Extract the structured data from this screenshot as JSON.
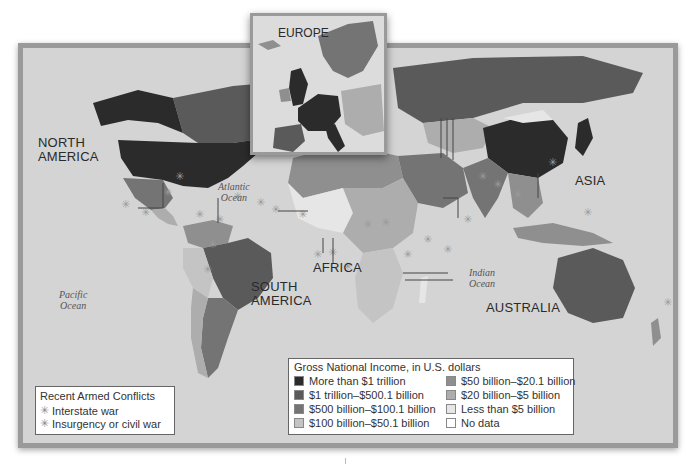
{
  "map": {
    "continent_labels": [
      {
        "id": "north-america",
        "lines": [
          "NORTH",
          "AMERICA"
        ]
      },
      {
        "id": "south-america",
        "lines": [
          "SOUTH",
          "AMERICA"
        ]
      },
      {
        "id": "africa",
        "lines": [
          "AFRICA"
        ]
      },
      {
        "id": "asia",
        "lines": [
          "ASIA"
        ]
      },
      {
        "id": "australia",
        "lines": [
          "AUSTRALIA"
        ]
      }
    ],
    "ocean_labels": [
      {
        "id": "atlantic",
        "lines": [
          "Atlantic",
          "Ocean"
        ]
      },
      {
        "id": "pacific",
        "lines": [
          "Pacific",
          "Ocean"
        ]
      },
      {
        "id": "indian",
        "lines": [
          "Indian",
          "Ocean"
        ]
      }
    ],
    "inset": {
      "title": "EUROPE"
    }
  },
  "conflicts_legend": {
    "title": "Recent Armed Conflicts",
    "items": [
      {
        "label": "Interstate war",
        "icon": "star-burst-icon"
      },
      {
        "label": "Insurgency or civil war",
        "icon": "star-burst-icon"
      }
    ]
  },
  "gni_legend": {
    "title": "Gross National Income, in U.S. dollars",
    "items": [
      {
        "label": "More than $1 trillion",
        "color": "#2b2b2b"
      },
      {
        "label": "$50 billion–$20.1 billion",
        "color": "#8f8f8f"
      },
      {
        "label": "$1 trillion–$500.1 billion",
        "color": "#5a5a5a"
      },
      {
        "label": "$20 billion–$5 billion",
        "color": "#adadad"
      },
      {
        "label": "$500 billion–$100.1 billion",
        "color": "#747474"
      },
      {
        "label": "Less than $5 billion",
        "color": "#e6e6e6"
      },
      {
        "label": "$100 billion–$50.1 billion",
        "color": "#c4c4c4"
      },
      {
        "label": "No data",
        "color": "#ffffff"
      }
    ]
  },
  "colors": {
    "ocean": "#d4d4d4",
    "frame": "#9a9a9a",
    "tier1": "#2b2b2b",
    "tier2": "#5a5a5a",
    "tier3": "#747474",
    "tier4": "#c4c4c4",
    "tier5": "#8f8f8f",
    "tier6": "#adadad",
    "tier7": "#e6e6e6"
  }
}
